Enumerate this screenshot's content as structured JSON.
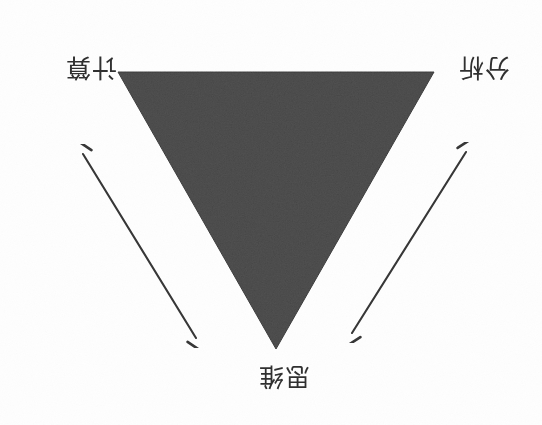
{
  "figure": {
    "type": "inverted-triangle-relationship-diagram",
    "orientation_note": "whole figure appears rotated 180 degrees (upside-down)",
    "background_color": "#fefefe",
    "triangle": {
      "fill_color": "#4f4f4f",
      "stroke_color": "#3c3c3c",
      "point_direction": "down",
      "vertices_px": [
        [
          118,
          72
        ],
        [
          434,
          72
        ],
        [
          276,
          349
        ]
      ],
      "texture": "grainy scanned paper"
    },
    "labels": [
      {
        "id": "vertex-a",
        "text": "计算",
        "position": "upper-left corner, outside triangle",
        "screen_xy_px": [
          62,
          48
        ]
      },
      {
        "id": "vertex-b",
        "text": "分析",
        "position": "upper-right corner, outside triangle",
        "screen_xy_px": [
          475,
          48
        ]
      },
      {
        "id": "vertex-c",
        "text": "思维",
        "position": "bottom center, below triangle apex",
        "screen_xy_px": [
          275,
          382
        ]
      }
    ],
    "arrows": [
      {
        "id": "arrow-top",
        "style": "double-headed",
        "color": "#353535",
        "from_px": [
          167,
          28
        ],
        "to_px": [
          383,
          28
        ],
        "connects": [
          "vertex-a",
          "vertex-b"
        ]
      },
      {
        "id": "arrow-left",
        "style": "double-headed",
        "color": "#353535",
        "from_px": [
          83,
          154
        ],
        "to_px": [
          196,
          338
        ],
        "connects": [
          "vertex-a",
          "vertex-c"
        ]
      },
      {
        "id": "arrow-right",
        "style": "double-headed",
        "color": "#353535",
        "from_px": [
          352,
          333
        ],
        "to_px": [
          466,
          152
        ],
        "connects": [
          "vertex-c",
          "vertex-b"
        ]
      }
    ]
  }
}
